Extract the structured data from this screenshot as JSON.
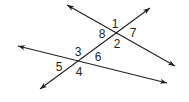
{
  "figure": {
    "type": "angle-diagram",
    "colors": {
      "line": "#231f20",
      "background": "#ffffff",
      "text": "#231f20"
    },
    "lines": [
      {
        "id": "line-a",
        "x1": 67,
        "y1": 5,
        "x2": 175,
        "y2": 66,
        "arrows": "both"
      },
      {
        "id": "transversal",
        "x1": 40,
        "y1": 89,
        "x2": 150,
        "y2": 8,
        "arrows": "both"
      },
      {
        "id": "line-c",
        "x1": 18,
        "y1": 46,
        "x2": 167,
        "y2": 83,
        "arrows": "both"
      }
    ],
    "intersections": [
      {
        "id": "upper",
        "x": 116,
        "y": 33
      },
      {
        "id": "lower",
        "x": 79,
        "y": 61
      }
    ],
    "angles": [
      {
        "label": "1",
        "x": 115,
        "y": 28
      },
      {
        "label": "7",
        "x": 133,
        "y": 37
      },
      {
        "label": "8",
        "x": 102,
        "y": 38
      },
      {
        "label": "2",
        "x": 117,
        "y": 48
      },
      {
        "label": "3",
        "x": 78,
        "y": 56
      },
      {
        "label": "6",
        "x": 98,
        "y": 61
      },
      {
        "label": "5",
        "x": 59,
        "y": 71
      },
      {
        "label": "4",
        "x": 79,
        "y": 76
      }
    ]
  }
}
